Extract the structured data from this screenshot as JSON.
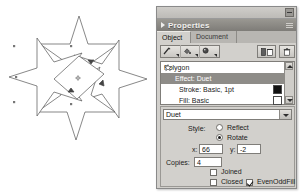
{
  "window": {
    "close_button": "close-box",
    "panel_title": "Properties",
    "grip": "resize-grip"
  },
  "tabs": [
    {
      "label": "Object",
      "active": true
    },
    {
      "label": "Document",
      "active": false
    }
  ],
  "toolbar": {
    "buttons": [
      {
        "name": "stroke-tool",
        "icon": "pen-icon"
      },
      {
        "name": "fill-tool",
        "icon": "paint-bucket-icon"
      },
      {
        "name": "effect-tool",
        "icon": "effect-icon"
      }
    ],
    "duplicate_label": "duplicate-button",
    "delete_label": "delete-button"
  },
  "object_list": {
    "rows": [
      {
        "label": "Polygon",
        "level": 0,
        "selected": false,
        "icon": "polygon-icon",
        "swatch": null
      },
      {
        "label": "Effect: Duet",
        "level": 1,
        "selected": true,
        "icon": null,
        "swatch": null
      },
      {
        "label": "Stroke: Basic, 1pt",
        "level": 2,
        "selected": false,
        "icon": null,
        "swatch": "black"
      },
      {
        "label": "Fill: Basic",
        "level": 2,
        "selected": false,
        "icon": null,
        "swatch": "white"
      }
    ]
  },
  "effect": {
    "preset_value": "Duet",
    "style_label": "Style:",
    "style_options": [
      {
        "label": "Reflect",
        "selected": false
      },
      {
        "label": "Rotate",
        "selected": true
      }
    ],
    "x_label": "x:",
    "x_value": "66",
    "y_label": "y:",
    "y_value": "-2",
    "copies_label": "Copies:",
    "copies_value": "4",
    "checkboxes": [
      {
        "label": "Joined",
        "checked": false
      },
      {
        "label": "Closed",
        "checked": false
      },
      {
        "label": "EvenOddFill",
        "checked": true
      }
    ]
  },
  "canvas": {
    "shape_name": "star-duet-artwork",
    "stroke_color": "#555555",
    "fill_color": "#ffffff",
    "center_marker": "transform-center-marker",
    "handles": "selection-handles"
  }
}
